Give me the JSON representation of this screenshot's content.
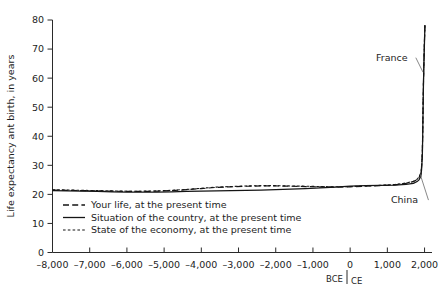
{
  "chart_data": {
    "type": "line",
    "title": "",
    "xlabel": "",
    "ylabel": "Life expectancy ant birth, in years",
    "xlim": [
      -8000,
      2200
    ],
    "ylim": [
      0,
      80
    ],
    "grid": false,
    "legend_position": "inside-bottom-left",
    "x_ticks": [
      -8000,
      -7000,
      -6000,
      -5000,
      -4000,
      -3000,
      -2000,
      -1000,
      0,
      1000,
      2000
    ],
    "x_tick_labels": [
      "–8,000",
      "–7,000",
      "–6,000",
      "–5,000",
      "–4,000",
      "–3,000",
      "–2,000",
      "–1,000",
      "0",
      "1,000",
      "2,000"
    ],
    "y_ticks": [
      0,
      10,
      20,
      30,
      40,
      50,
      60,
      70,
      80
    ],
    "y_tick_labels": [
      "0",
      "10",
      "20",
      "30",
      "40",
      "50",
      "60",
      "70",
      "80"
    ],
    "era_markers": [
      {
        "label": "BCE",
        "x": 0,
        "side": "left"
      },
      {
        "label": "CE",
        "x": 0,
        "side": "right"
      }
    ],
    "annotations": [
      {
        "label": "France",
        "target_x": 1960,
        "target_y": 62,
        "text_x": 1120,
        "text_y": 66
      },
      {
        "label": "China",
        "target_x": 1880,
        "target_y": 27,
        "text_x": 1460,
        "text_y": 17
      }
    ],
    "series": [
      {
        "name": "Your life, at the present time",
        "style": "dashed-long",
        "x": [
          -8000,
          -7600,
          -7200,
          -6800,
          -6400,
          -6000,
          -5600,
          -5200,
          -4800,
          -4400,
          -4000,
          -3600,
          -3200,
          -2800,
          -2400,
          -2000,
          -1600,
          -1200,
          -800,
          -400,
          0,
          400,
          800,
          1200,
          1500,
          1700,
          1800,
          1850,
          1900,
          1920,
          1940,
          1950,
          1960,
          1970,
          1980,
          1990,
          2000,
          2010
        ],
        "y": [
          21.5,
          21.4,
          21.3,
          21.2,
          21.1,
          21.0,
          21.0,
          21.1,
          21.3,
          21.6,
          22.0,
          22.4,
          22.6,
          22.8,
          22.9,
          22.9,
          22.8,
          22.7,
          22.6,
          22.5,
          22.6,
          22.8,
          23.0,
          23.3,
          23.8,
          24.4,
          25.1,
          25.8,
          27.0,
          29.5,
          34.0,
          41.0,
          50.0,
          58.0,
          64.0,
          69.0,
          74.0,
          78.5
        ]
      },
      {
        "name": "Situation of the country, at the present time",
        "style": "solid",
        "x": [
          -8000,
          -7600,
          -7200,
          -6800,
          -6400,
          -6000,
          -5600,
          -5200,
          -4800,
          -4400,
          -4000,
          -3600,
          -3200,
          -2800,
          -2400,
          -2000,
          -1600,
          -1200,
          -800,
          -400,
          0,
          400,
          800,
          1200,
          1500,
          1700,
          1800,
          1850,
          1900,
          1920,
          1940,
          1950,
          1960,
          1970,
          1980,
          1990,
          2000,
          2010
        ],
        "y": [
          21.3,
          21.2,
          21.1,
          21.0,
          20.9,
          20.8,
          20.8,
          20.8,
          20.9,
          21.0,
          21.1,
          21.2,
          21.3,
          21.4,
          21.5,
          21.6,
          21.8,
          22.0,
          22.2,
          22.5,
          22.8,
          23.0,
          23.1,
          23.2,
          23.4,
          23.8,
          24.4,
          25.0,
          26.2,
          28.5,
          33.0,
          40.0,
          49.0,
          57.5,
          63.5,
          68.5,
          73.5,
          78.0
        ]
      },
      {
        "name": "State of the economy, at the present time",
        "style": "dashed-short",
        "x": [
          -8000,
          -7600,
          -7200,
          -6800,
          -6400,
          -6000,
          -5600,
          -5200,
          -4800,
          -4400,
          -4000,
          -3600,
          -3200,
          -2800,
          -2400,
          -2000,
          -1600,
          -1200,
          -800,
          -400,
          0,
          400,
          800,
          1200,
          1500,
          1700,
          1800,
          1850,
          1900,
          1920,
          1940,
          1950,
          1960,
          1970,
          1980,
          1990,
          2000,
          2010
        ],
        "y": [
          21.6,
          21.5,
          21.4,
          21.3,
          21.2,
          21.1,
          21.1,
          21.2,
          21.4,
          21.7,
          22.1,
          22.5,
          22.7,
          22.9,
          23.0,
          23.0,
          22.9,
          22.8,
          22.7,
          22.6,
          22.7,
          22.9,
          23.1,
          23.4,
          23.9,
          24.5,
          25.2,
          26.0,
          27.4,
          30.0,
          34.5,
          41.5,
          50.5,
          58.5,
          64.5,
          69.5,
          74.5,
          79.0
        ]
      }
    ]
  },
  "legend": {
    "items": [
      {
        "label": "Your life, at the present time",
        "style": "dashed-long"
      },
      {
        "label": "Situation of the country, at the present time",
        "style": "solid"
      },
      {
        "label": "State of the economy, at the present time",
        "style": "dashed-short"
      }
    ]
  }
}
